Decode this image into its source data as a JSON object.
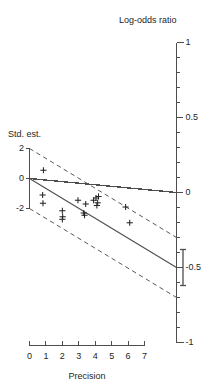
{
  "chart_data": {
    "type": "scatter",
    "title": "",
    "subtitle": "",
    "xlabel": "Precision",
    "ylabel": "Std. est.",
    "right_axis_label": "Log-odds ratio",
    "xlim": [
      0,
      7
    ],
    "ylim": [
      -3.4,
      2.6
    ],
    "right_axis_lim": [
      -1,
      1
    ],
    "grid": false,
    "legend": null,
    "xticks": [
      0,
      1,
      2,
      3,
      4,
      5,
      6,
      7
    ],
    "xticklabels": [
      "0",
      "1",
      "2",
      "3",
      "4",
      "5",
      "6",
      "7"
    ],
    "yticks": [
      2,
      0,
      -2
    ],
    "yticklabels": [
      "2",
      "0",
      "-2"
    ],
    "right_major_ticks": [
      1,
      0.5,
      0,
      -0.5,
      -1
    ],
    "right_major_ticklabels": [
      "1",
      "0.5",
      "0",
      "-0.5",
      "-1"
    ],
    "right_minor_tick_step": 0.1,
    "marker": "+",
    "points": [
      {
        "x": 0.85,
        "y": 0.55
      },
      {
        "x": 0.8,
        "y": -1.1
      },
      {
        "x": 0.82,
        "y": -1.65
      },
      {
        "x": 2.0,
        "y": -2.15
      },
      {
        "x": 2.02,
        "y": -2.55
      },
      {
        "x": 2.0,
        "y": -2.72
      },
      {
        "x": 2.95,
        "y": -1.45
      },
      {
        "x": 3.3,
        "y": -2.3
      },
      {
        "x": 3.35,
        "y": -2.45
      },
      {
        "x": 3.42,
        "y": -1.7
      },
      {
        "x": 3.9,
        "y": -1.45
      },
      {
        "x": 4.05,
        "y": -1.3
      },
      {
        "x": 4.1,
        "y": -1.8
      },
      {
        "x": 4.15,
        "y": -1.62
      },
      {
        "x": 4.2,
        "y": -1.2
      },
      {
        "x": 5.85,
        "y": -1.9
      },
      {
        "x": 6.1,
        "y": -2.95
      }
    ],
    "regression_line": {
      "slope": -0.5,
      "intercept": 0,
      "x_from": 0,
      "x_to": 7.05
    },
    "confidence_bands": [
      {
        "name": "upper",
        "style": "dashed",
        "offset": 2
      },
      {
        "name": "lower",
        "style": "dashed",
        "offset": -2
      }
    ],
    "summary_interval": {
      "center": -0.5,
      "low": -0.62,
      "high": -0.38,
      "style": "bracket"
    },
    "zero_reference_line": {
      "value": 0,
      "style": "solid"
    },
    "colors": {
      "axis": "#4d4d4d",
      "line": "#4d4d4d",
      "dashed": "#595959",
      "marker": "#262626",
      "text": "#262626",
      "background": "#ffffff"
    }
  },
  "axes": {
    "left_title": "Std. est.",
    "bottom_title": "Precision",
    "right_title": "Log-odds ratio"
  }
}
